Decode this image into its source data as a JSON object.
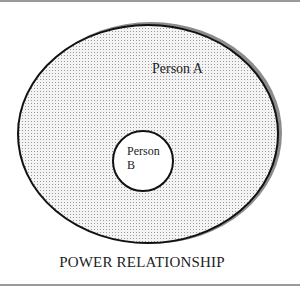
{
  "diagram": {
    "title": "POWER RELATIONSHIP",
    "outer": {
      "label": "Person A",
      "fill_pattern": "stipple-dots",
      "shadow_color": "#8c8c8c",
      "stroke_color": "#111111"
    },
    "inner": {
      "label_line1": "Person",
      "label_line2": "B",
      "fill_color": "#ffffff",
      "stroke_color": "#111111"
    }
  }
}
